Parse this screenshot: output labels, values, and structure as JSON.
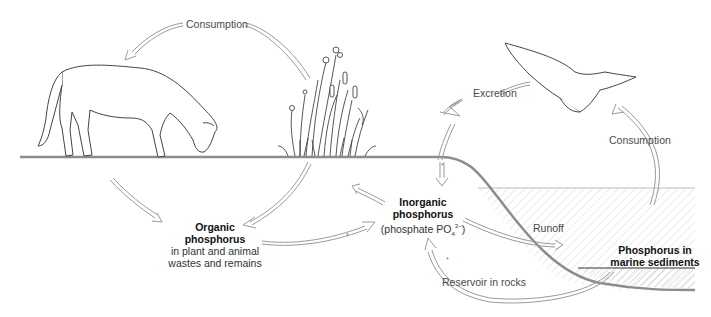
{
  "diagram": {
    "nodes": {
      "organic": {
        "title_line1": "Organic",
        "title_line2": "phosphorus",
        "desc_line1": "in plant and animal",
        "desc_line2": "wastes and remains"
      },
      "inorganic": {
        "title_line1": "Inorganic",
        "title_line2": "phosphorus",
        "desc_prefix": "(phosphate PO",
        "desc_sub": "4",
        "desc_sup": "3−",
        "desc_suffix": ")"
      },
      "marine": {
        "title_line1": "Phosphorus in",
        "title_line2": "marine sediments"
      }
    },
    "process_labels": {
      "consumption_land": "Consumption",
      "excretion": "Excretion",
      "consumption_sea": "Consumption",
      "runoff": "Runoff",
      "reservoir": "Reservoir in rocks"
    },
    "organisms": [
      "horse",
      "marsh-plants",
      "seabird"
    ],
    "colors": {
      "arrow_stroke": "#9a9a9a",
      "ground": "#8c8c8c",
      "water_hatch": "#cfcfcf",
      "text_bold": "#111111",
      "text": "#4a4a4a"
    }
  }
}
